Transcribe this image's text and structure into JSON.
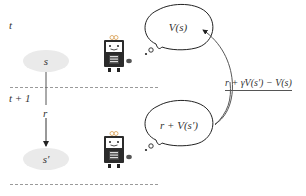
{
  "time_labels": {
    "t": "t",
    "t_plus_1": "t + 1"
  },
  "states": {
    "current": "s",
    "next": "s′"
  },
  "reward_label": "r",
  "thought_bubbles": {
    "top": "V(s)",
    "bottom": "r + V(s′)"
  },
  "td_error": "r + γV(s′) − V(s)",
  "icons": {
    "agent_top": "robot-icon",
    "agent_bottom": "robot-icon"
  },
  "colors": {
    "state_fill": "#eaeaea",
    "line": "#333333",
    "dashed_divider": "#9a9a9a",
    "robot_body": "#2b2b2b",
    "robot_face": "#ffffff",
    "robot_accent": "#e0b070"
  }
}
